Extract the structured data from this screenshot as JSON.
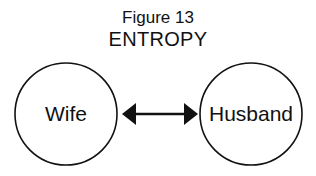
{
  "figure": {
    "number_label": "Figure 13",
    "title": "ENTROPY"
  },
  "nodes": [
    {
      "id": "wife",
      "label": "Wife"
    },
    {
      "id": "husband",
      "label": "Husband"
    }
  ],
  "edges": [
    {
      "from": "wife",
      "to": "husband",
      "type": "bidirectional-arrow"
    }
  ],
  "colors": {
    "stroke": "#111111",
    "background": "#ffffff"
  }
}
